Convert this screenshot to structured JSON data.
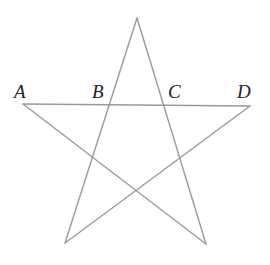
{
  "figure": {
    "type": "pentagram",
    "stroke_color": "#9a9a9a",
    "vertices": {
      "apex": [
        137,
        18
      ],
      "left": [
        23,
        104
      ],
      "right": [
        250,
        106
      ],
      "bottom_left": [
        65,
        243
      ],
      "bottom_right": [
        206,
        244
      ]
    },
    "labels": [
      {
        "text": "A",
        "x": 14,
        "y": 98
      },
      {
        "text": "B",
        "x": 92,
        "y": 98
      },
      {
        "text": "C",
        "x": 168,
        "y": 98
      },
      {
        "text": "D",
        "x": 237,
        "y": 98
      }
    ]
  }
}
